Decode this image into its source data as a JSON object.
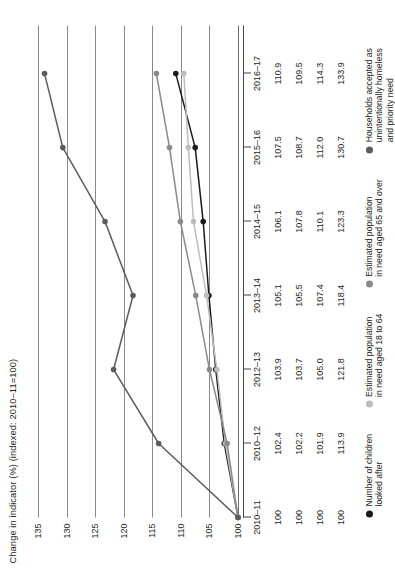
{
  "chart_data": {
    "type": "line",
    "title": "Change in indicator (%) (indexed: 2010–11=100)",
    "xlabel": "",
    "ylabel": "Change in indicator (%) (indexed: 2010–11=100)",
    "categories": [
      "2010–11",
      "2010–12",
      "2012–13",
      "2013–14",
      "2014–15",
      "2015–16",
      "2016–17"
    ],
    "yticks": [
      100,
      105,
      110,
      115,
      120,
      125,
      130,
      135
    ],
    "ylim": [
      100,
      137.5
    ],
    "grid": true,
    "legend_position": "bottom-left",
    "series": [
      {
        "name": "Number of children looked after",
        "color": "#1a1a1a",
        "values": [
          100,
          102.4,
          103.9,
          105.1,
          106.1,
          107.5,
          110.9
        ]
      },
      {
        "name": "Estimated population in need aged 18 to 64",
        "color": "#bdbdbd",
        "values": [
          100,
          102.2,
          103.7,
          105.5,
          107.8,
          108.7,
          109.5
        ]
      },
      {
        "name": "Estimated population in need aged 65 and over",
        "color": "#8a8a8a",
        "values": [
          100,
          101.9,
          105.0,
          107.4,
          110.1,
          112.0,
          114.3
        ]
      },
      {
        "name": "Households accepted as unintentionally homeless and priority need",
        "color": "#5c5c5c",
        "values": [
          100,
          113.9,
          121.8,
          118.4,
          123.3,
          130.7,
          133.9
        ]
      }
    ]
  },
  "table": {
    "header": [
      "2010–11",
      "2010–12",
      "2012–13",
      "2013–14",
      "2014–15",
      "2015–16",
      "2016–17"
    ],
    "rows": [
      [
        "100",
        "102.4",
        "103.9",
        "105.1",
        "106.1",
        "107.5",
        "110.9"
      ],
      [
        "100",
        "102.2",
        "103.7",
        "105.5",
        "107.8",
        "108.7",
        "109.5"
      ],
      [
        "100",
        "101.9",
        "105.0",
        "107.4",
        "110.1",
        "112.0",
        "114.3"
      ],
      [
        "100",
        "113.9",
        "121.8",
        "118.4",
        "123.3",
        "130.7",
        "133.9"
      ]
    ]
  },
  "legend": {
    "items": [
      {
        "label": "Number of children\nlooked after",
        "color": "#1a1a1a"
      },
      {
        "label": "Estimated population\nin need aged 18 to 64",
        "color": "#bdbdbd"
      },
      {
        "label": "Estimated population\nin need aged 65 and over",
        "color": "#8a8a8a"
      },
      {
        "label": "Households accepted as\nunintentionally homeless\nand priority need",
        "color": "#5c5c5c"
      }
    ]
  }
}
